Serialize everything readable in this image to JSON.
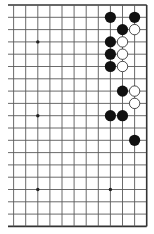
{
  "diagram": {
    "type": "go-board-fragment",
    "board_size": 19,
    "visible_columns": [
      8,
      19
    ],
    "visible_rows": [
      1,
      19
    ],
    "open_edges": [
      "left"
    ],
    "colors": {
      "background": "#ffffff",
      "grid_line": "#5a5a5a",
      "edge_line": "#333333",
      "black_stone": "#111111",
      "white_stone_fill": "#ffffff",
      "white_stone_outline": "#222222",
      "star_point": "#222222"
    },
    "star_points": [
      {
        "col": 10,
        "row": 4
      },
      {
        "col": 10,
        "row": 10
      },
      {
        "col": 10,
        "row": 16
      },
      {
        "col": 16,
        "row": 16
      }
    ],
    "stones": [
      {
        "color": "black",
        "col": 16,
        "row": 2
      },
      {
        "color": "black",
        "col": 18,
        "row": 2
      },
      {
        "color": "black",
        "col": 17,
        "row": 3
      },
      {
        "color": "white",
        "col": 18,
        "row": 3
      },
      {
        "color": "black",
        "col": 16,
        "row": 4
      },
      {
        "color": "white",
        "col": 17,
        "row": 4
      },
      {
        "color": "black",
        "col": 16,
        "row": 5
      },
      {
        "color": "white",
        "col": 17,
        "row": 5
      },
      {
        "color": "black",
        "col": 16,
        "row": 6
      },
      {
        "color": "white",
        "col": 17,
        "row": 6
      },
      {
        "color": "black",
        "col": 17,
        "row": 8
      },
      {
        "color": "white",
        "col": 18,
        "row": 8
      },
      {
        "color": "white",
        "col": 18,
        "row": 9
      },
      {
        "color": "black",
        "col": 16,
        "row": 10
      },
      {
        "color": "black",
        "col": 17,
        "row": 10
      },
      {
        "color": "black",
        "col": 18,
        "row": 12
      }
    ]
  }
}
